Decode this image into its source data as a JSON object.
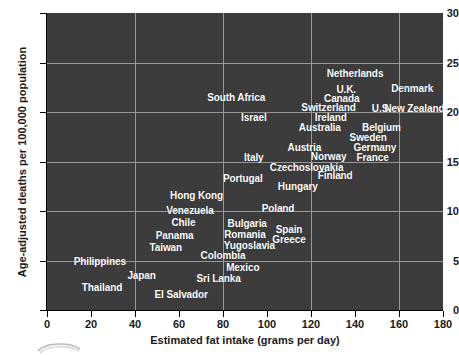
{
  "chart_data": {
    "type": "scatter",
    "title": "",
    "xlabel": "Estimated fat intake (grams per day)",
    "ylabel": "Age-adjusted deaths per 100,000 population",
    "xlim": [
      0,
      180
    ],
    "ylim": [
      0,
      30
    ],
    "xticks": [
      0,
      20,
      40,
      60,
      80,
      100,
      120,
      140,
      160,
      180
    ],
    "yticks": [
      0,
      5,
      10,
      15,
      20,
      25,
      30
    ],
    "xgridlines": [
      40,
      80,
      120,
      160
    ],
    "ygridlines": [
      5,
      10,
      15,
      20,
      25
    ],
    "grid": true,
    "legend": false,
    "plot_background": "#3a3a3a",
    "label_color": "#ffffff",
    "points": [
      {
        "label": "Netherlands",
        "x": 140,
        "y": 23.8
      },
      {
        "label": "U.K.",
        "x": 136,
        "y": 22.2
      },
      {
        "label": "Denmark",
        "x": 166,
        "y": 22.3
      },
      {
        "label": "Canada",
        "x": 134,
        "y": 21.3
      },
      {
        "label": "South Africa",
        "x": 86,
        "y": 21.4
      },
      {
        "label": "Switzerland",
        "x": 128,
        "y": 20.4
      },
      {
        "label": "U.S.",
        "x": 152,
        "y": 20.3
      },
      {
        "label": "New Zealand",
        "x": 167,
        "y": 20.3
      },
      {
        "label": "Ireland",
        "x": 129,
        "y": 19.4
      },
      {
        "label": "Israel",
        "x": 94,
        "y": 19.4
      },
      {
        "label": "Australia",
        "x": 124,
        "y": 18.4
      },
      {
        "label": "Belgium",
        "x": 152,
        "y": 18.4
      },
      {
        "label": "Sweden",
        "x": 146,
        "y": 17.4
      },
      {
        "label": "Austria",
        "x": 117,
        "y": 16.4
      },
      {
        "label": "Germany",
        "x": 149,
        "y": 16.4
      },
      {
        "label": "Norway",
        "x": 128,
        "y": 15.5
      },
      {
        "label": "France",
        "x": 148,
        "y": 15.4
      },
      {
        "label": "Italy",
        "x": 94,
        "y": 15.4
      },
      {
        "label": "Czechoslovakia",
        "x": 118,
        "y": 14.3
      },
      {
        "label": "Finland",
        "x": 131,
        "y": 13.5
      },
      {
        "label": "Portugal",
        "x": 89,
        "y": 13.2
      },
      {
        "label": "Hungary",
        "x": 114,
        "y": 12.4
      },
      {
        "label": "Hong Kong",
        "x": 68,
        "y": 11.5
      },
      {
        "label": "Poland",
        "x": 105,
        "y": 10.2
      },
      {
        "label": "Venezuela",
        "x": 65,
        "y": 10.0
      },
      {
        "label": "Chile",
        "x": 62,
        "y": 8.8
      },
      {
        "label": "Bulgaria",
        "x": 91,
        "y": 8.7
      },
      {
        "label": "Spain",
        "x": 110,
        "y": 8.1
      },
      {
        "label": "Romania",
        "x": 90,
        "y": 7.6
      },
      {
        "label": "Panama",
        "x": 58,
        "y": 7.5
      },
      {
        "label": "Greece",
        "x": 110,
        "y": 7.1
      },
      {
        "label": "Yugoslavia",
        "x": 92,
        "y": 6.5
      },
      {
        "label": "Taiwan",
        "x": 54,
        "y": 6.3
      },
      {
        "label": "Colombia",
        "x": 80,
        "y": 5.5
      },
      {
        "label": "Philippines",
        "x": 24,
        "y": 4.8
      },
      {
        "label": "Mexico",
        "x": 89,
        "y": 4.2
      },
      {
        "label": "Japan",
        "x": 43,
        "y": 3.4
      },
      {
        "label": "Sri Lanka",
        "x": 78,
        "y": 3.1
      },
      {
        "label": "Thailand",
        "x": 25,
        "y": 2.2
      },
      {
        "label": "El Salvador",
        "x": 61,
        "y": 1.5
      }
    ]
  },
  "axes": {
    "x_axis_label": "Estimated fat intake (grams per day)",
    "y_axis_label": "Age-adjusted deaths per 100,000 population",
    "x_tick_labels": [
      "0",
      "20",
      "40",
      "60",
      "80",
      "100",
      "120",
      "140",
      "160",
      "180"
    ],
    "y_tick_labels": [
      "0",
      "5",
      "10",
      "15",
      "20",
      "25",
      "30"
    ]
  }
}
